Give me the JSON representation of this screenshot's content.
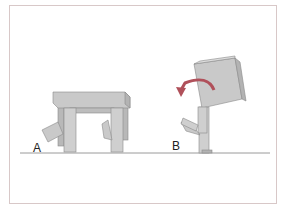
{
  "figure": {
    "panels": [
      {
        "label": "A",
        "description": "table with one leg lifted and bending"
      },
      {
        "label": "B",
        "description": "tall box on legs tipping backward with rotation arrow"
      }
    ],
    "colors": {
      "frame": "#d8c8c8",
      "block_face": "#c9c9c9",
      "block_top": "#dedede",
      "block_side": "#b3b3b3",
      "outline": "#8a8a8a",
      "ground": "#9a9a9a",
      "arrow": "#b0505a"
    }
  }
}
